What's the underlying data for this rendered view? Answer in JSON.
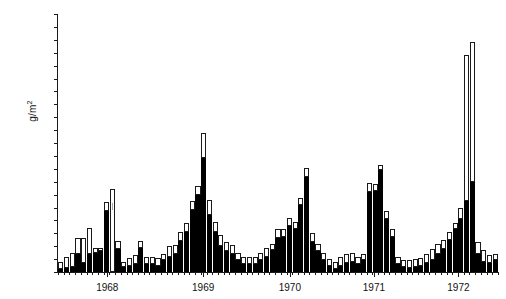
{
  "chart_data": {
    "type": "bar",
    "title": "",
    "subtitle": "",
    "xlabel": "",
    "ylabel": "g/m2",
    "ylabel_display": "g/m",
    "ylabel_exponent": "2",
    "ylim": [
      0,
      200
    ],
    "ytick_step": 10,
    "yticks": [
      0,
      10,
      20,
      30,
      40,
      50,
      60,
      70,
      80,
      90,
      100,
      110,
      120,
      130,
      140,
      150,
      160,
      170,
      180,
      190,
      200
    ],
    "grid": false,
    "legend_position": "none",
    "stacked": true,
    "series": [
      {
        "name": "solid (black) fraction",
        "fill": "#000000",
        "values": [
          2,
          3,
          4,
          14,
          7,
          14,
          15,
          16,
          47,
          null,
          18,
          4,
          5,
          6,
          19,
          6,
          6,
          5,
          9,
          12,
          14,
          24,
          31,
          48,
          60,
          88,
          44,
          31,
          20,
          16,
          14,
          9,
          6,
          6,
          6,
          9,
          12,
          17,
          26,
          27,
          36,
          33,
          52,
          74,
          23,
          16,
          9,
          5,
          2,
          5,
          7,
          8,
          6,
          9,
          62,
          63,
          79,
          41,
          27,
          6,
          4,
          3,
          4,
          5,
          7,
          9,
          14,
          18,
          25,
          33,
          41,
          55,
          70,
          14,
          8,
          7,
          9
        ]
      },
      {
        "name": "open (white) fraction",
        "fill": "#ffffff",
        "values": [
          6,
          9,
          11,
          12,
          19,
          20,
          4,
          3,
          7,
          null,
          6,
          4,
          6,
          7,
          5,
          6,
          6,
          6,
          5,
          8,
          7,
          7,
          7,
          7,
          7,
          20,
          12,
          8,
          9,
          7,
          7,
          6,
          6,
          6,
          6,
          6,
          7,
          5,
          7,
          6,
          6,
          6,
          5,
          7,
          7,
          6,
          6,
          5,
          6,
          7,
          7,
          7,
          6,
          5,
          7,
          5,
          4,
          6,
          6,
          6,
          5,
          6,
          6,
          6,
          7,
          9,
          8,
          7,
          6,
          5,
          9,
          113,
          108,
          9,
          9,
          6,
          5
        ]
      }
    ],
    "gap_bar": {
      "index": 9,
      "total": 64,
      "note": "tall open bar with hatched annotation marking a data gap between 1968 and 1969"
    },
    "year_labels": [
      {
        "label": "1968",
        "x_fraction": 0.112
      },
      {
        "label": "1969",
        "x_fraction": 0.33
      },
      {
        "label": "1970",
        "x_fraction": 0.527
      },
      {
        "label": "1971",
        "x_fraction": 0.718
      },
      {
        "label": "1972",
        "x_fraction": 0.91
      }
    ]
  }
}
